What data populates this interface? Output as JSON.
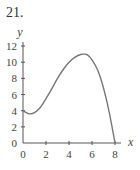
{
  "problem_number": "21.",
  "chart_data": {
    "type": "line",
    "title": "",
    "xlabel": "x",
    "ylabel": "y",
    "xlim": [
      0,
      8
    ],
    "ylim": [
      0,
      12
    ],
    "x_ticks": [
      0,
      2,
      4,
      6,
      8
    ],
    "y_ticks": [
      0,
      2,
      4,
      6,
      8,
      10,
      12
    ],
    "grid": false,
    "legend": null,
    "series": [
      {
        "name": "f(x)",
        "color": "#777777",
        "x": [
          0,
          0.3,
          0.6,
          1,
          1.5,
          2,
          2.5,
          3,
          3.5,
          4,
          4.5,
          5,
          5.3,
          5.6,
          6,
          6.5,
          7,
          7.5,
          8
        ],
        "y": [
          4,
          3.75,
          3.6,
          3.75,
          4.4,
          5.5,
          6.7,
          8,
          9.1,
          10,
          10.6,
          10.95,
          11,
          10.9,
          10.3,
          9.0,
          6.8,
          3.8,
          0
        ]
      }
    ]
  }
}
